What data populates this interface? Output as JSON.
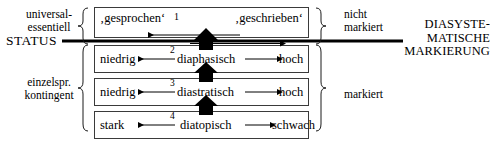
{
  "figure": {
    "title_right": [
      "DIASYSTE-",
      "MATISCHE",
      "MARKIERUNG"
    ],
    "status_label": "STATUS",
    "left_groups": [
      {
        "lines": [
          "universal-",
          "essentiell"
        ]
      },
      {
        "lines": [
          "einzelspr.",
          "kontingent"
        ]
      }
    ],
    "right_groups": [
      {
        "lines": [
          "nicht",
          "markiert"
        ]
      },
      {
        "lines": [
          "markiert"
        ]
      }
    ],
    "rows": [
      {
        "index": "1",
        "left": "‚gesprochen‘",
        "center": "",
        "right": "‚geschrieben‘",
        "left_arrow": true,
        "right_arrow": true,
        "thick_rule": true
      },
      {
        "index": "2",
        "left": "niedrig",
        "center": "diaphasisch",
        "right": "hoch",
        "left_arrow": true,
        "right_arrow": true,
        "thick_rule": false
      },
      {
        "index": "3",
        "left": "niedrig",
        "center": "diastratisch",
        "right": "hoch",
        "left_arrow": true,
        "right_arrow": true,
        "thick_rule": false
      },
      {
        "index": "4",
        "left": "stark",
        "center": "diatopisch",
        "right": "schwach",
        "left_arrow": true,
        "right_arrow": true,
        "thick_rule": false
      }
    ],
    "vertical_arrows": 3,
    "colors": {
      "ink": "#000000",
      "box_border": "#3a3a3a"
    }
  }
}
